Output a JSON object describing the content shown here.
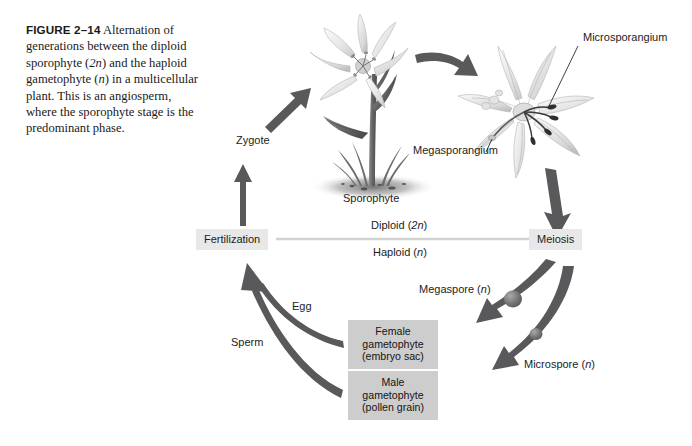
{
  "figure": {
    "number": "FIGURE 2–14",
    "caption_parts": {
      "p1": "Alternation of generations between the diploid sporophyte (",
      "i1": "2n",
      "p2": ") and the haploid gametophyte (",
      "i2": "n",
      "p3": ") in a multicellular plant. This is an angiosperm, where the sporophyte stage is the predominant phase."
    }
  },
  "labels": {
    "zygote": "Zygote",
    "sporophyte": "Sporophyte",
    "microsporangium": "Microsporangium",
    "megasporangium": "Megasporangium",
    "egg": "Egg",
    "sperm": "Sperm",
    "megaspore_text": "Megaspore (",
    "megaspore_italic": "n",
    "megaspore_close": ")",
    "microspore_text": "Microspore (",
    "microspore_italic": "n",
    "microspore_close": ")"
  },
  "stages": {
    "fertilization": "Fertilization",
    "meiosis": "Meiosis"
  },
  "ploidy": {
    "diploid_text": "Diploid (",
    "diploid_italic": "2n",
    "diploid_close": ")",
    "haploid_text": "Haploid (",
    "haploid_italic": "n",
    "haploid_close": ")"
  },
  "gametophytes": {
    "female": {
      "line1": "Female",
      "line2": "gametophyte",
      "line3": "(embryo sac)"
    },
    "male": {
      "line1": "Male",
      "line2": "gametophyte",
      "line3": "(pollen grain)"
    }
  },
  "colors": {
    "background": "#ffffff",
    "text": "#1c1c1c",
    "arrow": "#59595b",
    "arrow_dark": "#4a4a4c",
    "stage_box": "#e8e8e8",
    "gametophyte_box": "#cdcdcd",
    "divider_line": "#d2d2d2",
    "plant_stem": "#6e6e6e",
    "petal_light": "#efefef",
    "soil_shadow": "#9a9a9a"
  }
}
